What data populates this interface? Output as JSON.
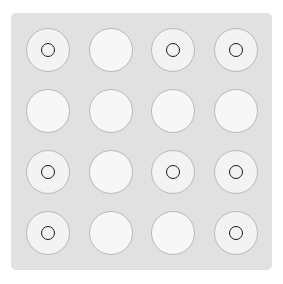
{
  "board": {
    "rows": 4,
    "cols": 4,
    "colors": {
      "background": "#ffffff",
      "panel": "#e1e1e1",
      "cell_fill": "#f3f3f3",
      "cell_border": "#b9b9b9",
      "marker": "#1a1a1a"
    },
    "marker_icon": "ring-icon",
    "cells": [
      [
        true,
        false,
        true,
        true
      ],
      [
        false,
        false,
        false,
        false
      ],
      [
        true,
        false,
        true,
        true
      ],
      [
        true,
        false,
        false,
        true
      ]
    ]
  }
}
